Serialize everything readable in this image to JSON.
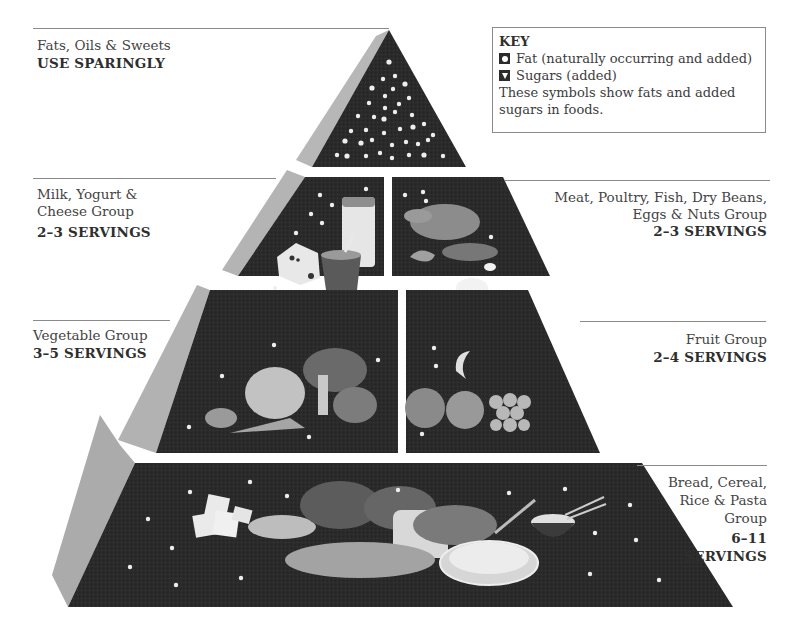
{
  "key": {
    "title": "KEY",
    "items": [
      {
        "symbol": "fat-circle-icon",
        "label": "Fat (naturally occurring and added)"
      },
      {
        "symbol": "sugar-triangle-icon",
        "label": "Sugars (added)"
      }
    ],
    "note": "These symbols show fats and added sugars in foods."
  },
  "groups": [
    {
      "name": "Fats, Oils & Sweets",
      "servings": "USE SPARINGLY",
      "side": "left"
    },
    {
      "name_line1": "Milk, Yogurt &",
      "name_line2": "Cheese Group",
      "servings": "2–3 SERVINGS",
      "side": "left"
    },
    {
      "name_line1": "Meat, Poultry, Fish, Dry Beans,",
      "name_line2": "Eggs & Nuts Group",
      "servings": "2–3 SERVINGS",
      "side": "right"
    },
    {
      "name": "Vegetable Group",
      "servings": "3–5 SERVINGS",
      "side": "left"
    },
    {
      "name": "Fruit Group",
      "servings": "2–4 SERVINGS",
      "side": "right"
    },
    {
      "name_line1": "Bread, Cereal,",
      "name_line2": "Rice & Pasta",
      "name_line3": "Group",
      "servings_line1": "6–11",
      "servings_line2": "SERVINGS",
      "side": "right"
    }
  ],
  "colors": {
    "tier_fill": "#2a2a2a",
    "side_face": "#b4b4b4",
    "side_face_dark": "#9c9c9c",
    "food_gray": "#8c8c8c",
    "food_light": "#d8d8d8",
    "rule": "#8a8a8a"
  }
}
